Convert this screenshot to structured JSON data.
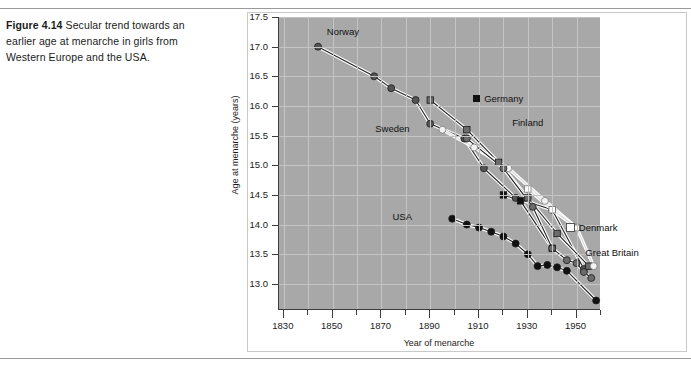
{
  "caption": {
    "label": "Figure 4.14",
    "text": "Secular trend towards an earlier age at menarche in girls from Western Europe and the USA."
  },
  "chart_data": {
    "type": "line",
    "title": "",
    "xlabel": "Year of menarche",
    "ylabel": "Age at menarche (years)",
    "xlim": [
      1828,
      1960
    ],
    "ylim": [
      12.56,
      17.5
    ],
    "yticks": [
      "17.5",
      "17.0",
      "16.5",
      "16.0",
      "15.5",
      "15.0",
      "14.5",
      "14.0",
      "13.5",
      "13.0"
    ],
    "ytick_values": [
      17.5,
      17.0,
      16.5,
      16.0,
      15.5,
      15.0,
      14.5,
      14.0,
      13.5,
      13.0
    ],
    "xticks_major": [
      "1830",
      "1850",
      "1870",
      "1890",
      "1910",
      "1930",
      "1950"
    ],
    "xtick_major_values": [
      1830,
      1850,
      1870,
      1890,
      1910,
      1930,
      1950
    ],
    "xtick_minor_values": [
      1840,
      1860,
      1880,
      1900,
      1920,
      1940,
      1960
    ],
    "grid": true,
    "legend": "inline-labels",
    "plot_background": "#a8a8a8",
    "series": [
      {
        "name": "Norway",
        "marker": "circle",
        "color": "#545454",
        "label_x": 1848,
        "label_y": 17.25,
        "x": [
          1844,
          1867,
          1874,
          1884,
          1890,
          1904,
          1912,
          1925,
          1940,
          1953
        ],
        "y": [
          17.0,
          16.5,
          16.3,
          16.1,
          15.7,
          15.45,
          14.95,
          14.45,
          14.25,
          13.25
        ]
      },
      {
        "name": "Finland",
        "marker": "square",
        "color": "#6b6b6b",
        "label_x": 1924,
        "label_y": 15.72,
        "x": [
          1890,
          1905,
          1918,
          1930,
          1942,
          1955
        ],
        "y": [
          16.1,
          15.6,
          15.05,
          14.45,
          13.85,
          13.3
        ]
      },
      {
        "name": "Germany",
        "marker": "square",
        "color": "#111111",
        "label_x": 1908,
        "label_y": 16.12,
        "x": [
          1920,
          1927,
          1940
        ],
        "y": [
          14.5,
          14.4,
          13.6
        ]
      },
      {
        "name": "Sweden",
        "marker": "circle-open",
        "color": "#f2f2f2",
        "label_x": 1884,
        "label_y": 15.62,
        "x": [
          1895,
          1908,
          1922,
          1937,
          1950,
          1957
        ],
        "y": [
          15.6,
          15.3,
          14.95,
          14.4,
          13.95,
          13.3
        ]
      },
      {
        "name": "Denmark",
        "marker": "square-open",
        "color": "#ffffff",
        "label_x": 1946,
        "label_y": 13.95,
        "x": [
          1930,
          1940,
          1950
        ],
        "y": [
          14.6,
          14.25,
          13.95
        ]
      },
      {
        "name": "Great Britain",
        "marker": "circle",
        "color": "#6b6b6b",
        "label_x": 1954,
        "label_y": 13.52,
        "x": [
          1905,
          1920,
          1932,
          1940,
          1946,
          1950,
          1953,
          1956
        ],
        "y": [
          15.45,
          14.95,
          14.3,
          13.6,
          13.4,
          13.35,
          13.2,
          13.1
        ]
      },
      {
        "name": "USA",
        "marker": "circle",
        "color": "#111111",
        "label_x": 1885,
        "label_y": 14.12,
        "x": [
          1899,
          1905,
          1910,
          1915,
          1920,
          1925,
          1930,
          1934,
          1938,
          1942,
          1946,
          1958
        ],
        "y": [
          14.1,
          14.0,
          13.95,
          13.88,
          13.8,
          13.68,
          13.5,
          13.3,
          13.32,
          13.28,
          13.22,
          12.72
        ]
      }
    ]
  }
}
